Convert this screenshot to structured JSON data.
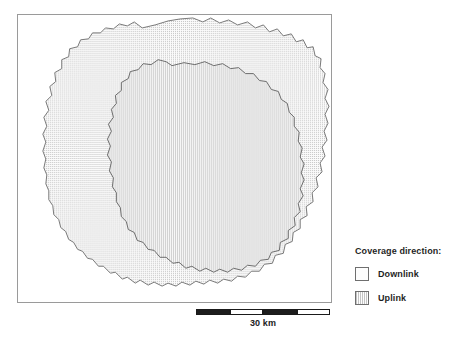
{
  "map": {
    "frame": {
      "x": 17,
      "y": 14,
      "width": 315,
      "height": 289
    },
    "outer_region": {
      "name": "Downlink",
      "fill_pattern": "fine-dot-grid",
      "fill_color": "#fbfbfb",
      "dot_color": "#c3c3c3",
      "stroke_color": "#6b6b6b",
      "points": "125,13 138,10 151,6 163,4 176,3 186,7 194,3 203,8 212,5 221,10 231,7 239,13 247,10 253,17 261,14 267,21 275,19 280,27 287,25 291,33 297,32 299,41 305,44 304,53 309,59 307,68 312,75 309,84 313,92 309,100 312,109 308,117 311,126 306,133 309,142 304,149 306,158 300,164 302,173 296,179 297,188 290,193 291,202 284,206 284,215 277,219 276,228 269,231 267,240 259,242 256,250 248,251 243,258 235,258 229,264 221,263 215,268 207,266 201,270 193,267 187,271 179,268 173,272 165,269 159,273 151,270 145,273 137,269 131,272 123,267 118,270 110,264 105,266 98,259 93,260 86,253 81,253 75,246 70,245 65,238 60,236 56,229 51,226 48,218 43,214 41,206 36,201 35,192 31,186 31,177 28,170 29,161 26,154 28,145 25,137 28,128 25,120 29,112 26,103 31,96 28,87 34,81 32,72 38,67 37,58 44,54 44,45 51,42 52,34 60,32 63,25 71,24 75,18 83,18 88,13 96,14 102,9 110,11 117,7"
    },
    "inner_region": {
      "name": "Uplink",
      "fill_pattern": "vertical-hatch",
      "fill_color": "#f6f6f6",
      "line_color": "#c9c9c9",
      "stroke_color": "#5e5e5e",
      "points": "155,51 167,48 178,50 188,47 197,51 206,49 214,54 222,53 229,59 237,59 243,66 250,67 255,75 262,77 265,85 271,89 273,98 278,103 278,112 283,118 282,127 286,134 284,143 288,150 285,159 288,166 284,175 287,182 282,190 284,198 278,204 279,212 272,217 272,225 264,229 263,237 255,239 252,246 244,247 239,253 231,252 225,257 217,255 211,259 203,256 197,259 189,255 183,258 175,253 169,255 162,249 156,250 149,244 143,244 137,237 131,236 126,229 120,227 117,219 111,216 109,208 104,203 103,194 99,188 99,179 95,173 96,164 92,157 94,148 90,141 93,132 90,125 94,117 91,110 96,103 94,95 99,89 98,81 104,76 104,68 111,64 113,57 121,55 126,49 134,50 141,45 149,47"
    }
  },
  "scalebar": {
    "label": "30 km",
    "segments": [
      {
        "type": "dark",
        "left": 0,
        "width": 34
      },
      {
        "type": "light",
        "left": 34,
        "width": 33
      },
      {
        "type": "dark",
        "left": 67,
        "width": 34
      },
      {
        "type": "light",
        "left": 101,
        "width": 33
      }
    ]
  },
  "legend": {
    "title": "Coverage direction:",
    "items": [
      {
        "label": "Downlink",
        "pattern": "dots",
        "swatch_name": "legend-swatch-downlink"
      },
      {
        "label": "Uplink",
        "pattern": "vlines",
        "swatch_name": "legend-swatch-uplink"
      }
    ]
  }
}
